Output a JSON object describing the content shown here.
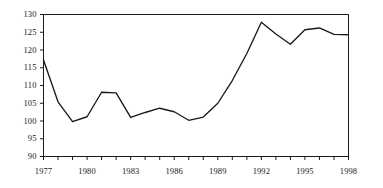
{
  "chart_data": {
    "type": "line",
    "title": "",
    "subtitle": "",
    "xlabel": "",
    "ylabel": "",
    "xlim": [
      1977,
      1998
    ],
    "ylim": [
      90,
      130
    ],
    "grid": false,
    "legend": "none",
    "yticks": [
      90,
      95,
      100,
      105,
      110,
      115,
      120,
      125,
      130
    ],
    "ytick_labels": [
      "90",
      "95",
      "100",
      "105",
      "110",
      "115",
      "120",
      "125",
      "130"
    ],
    "xticks": [
      1977,
      1980,
      1983,
      1986,
      1989,
      1992,
      1995,
      1998
    ],
    "xtick_labels": [
      "1977",
      "1980",
      "1983",
      "1986",
      "1989",
      "1992",
      "1995",
      "1998"
    ],
    "x": [
      1977,
      1978,
      1979,
      1980,
      1981,
      1982,
      1983,
      1984,
      1985,
      1986,
      1987,
      1988,
      1989,
      1990,
      1991,
      1992,
      1993,
      1994,
      1995,
      1996,
      1997,
      1998
    ],
    "series": [
      {
        "name": "",
        "color": "#1a1a1a",
        "values": [
          117.2,
          105.4,
          99.8,
          101.2,
          108.1,
          107.9,
          101.0,
          102.4,
          103.6,
          102.6,
          100.2,
          101.1,
          105.0,
          111.4,
          119.0,
          127.8,
          124.5,
          121.6,
          125.7,
          126.2,
          124.4,
          124.3
        ]
      }
    ]
  },
  "axes": {
    "frame_color": "#1a1a1a",
    "tick_color": "#1a1a1a",
    "background": "#ffffff"
  }
}
